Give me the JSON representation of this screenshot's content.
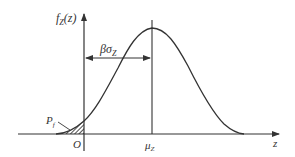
{
  "diagram": {
    "type": "probability-density-curve",
    "y_axis_label": "f",
    "y_axis_label_sub": "Z",
    "y_axis_label_arg": "(z)",
    "x_axis_label": "z",
    "origin_label": "O",
    "mean_label": "μ",
    "mean_label_sub": "Z",
    "distance_label": "βσ",
    "distance_label_sub": "Z",
    "failure_prob_label": "P",
    "failure_prob_label_sub": "f",
    "colors": {
      "line": "#333333",
      "background": "#ffffff"
    }
  }
}
